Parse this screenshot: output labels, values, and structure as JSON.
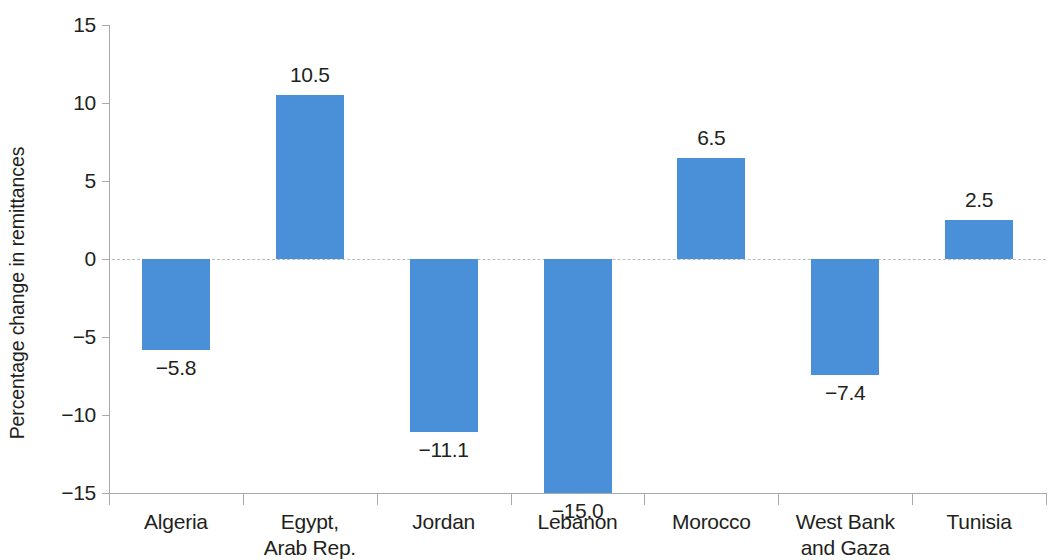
{
  "chart_data": {
    "type": "bar",
    "title": "",
    "subtitle": "",
    "xlabel": "",
    "ylabel": "Percentage change in remittances",
    "categories": [
      "Algeria",
      "Egypt, Arab Rep.",
      "Jordan",
      "Lebanon",
      "Morocco",
      "West Bank and Gaza",
      "Tunisia"
    ],
    "category_lines": [
      [
        "Algeria"
      ],
      [
        "Egypt,",
        "Arab Rep."
      ],
      [
        "Jordan"
      ],
      [
        "Lebanon"
      ],
      [
        "Morocco"
      ],
      [
        "West Bank",
        "and Gaza"
      ],
      [
        "Tunisia"
      ]
    ],
    "values": [
      -5.8,
      10.5,
      -11.1,
      -15.0,
      6.5,
      -7.4,
      2.5
    ],
    "value_labels": [
      "−5.8",
      "10.5",
      "−11.1",
      "−15.0",
      "6.5",
      "−7.4",
      "2.5"
    ],
    "ylim": [
      -15,
      15
    ],
    "yticks": [
      15,
      10,
      5,
      0,
      -5,
      -10,
      -15
    ],
    "ytick_labels": [
      "15",
      "10",
      "5",
      "0",
      "−5",
      "−10",
      "−15"
    ],
    "grid": false,
    "zero_line": true,
    "legend": null,
    "bar_color": "#4a90d9",
    "axis_color": "#a7a9ac",
    "zero_line_color": "#b9bbbd",
    "text_color": "#231f20",
    "note": "Lebanon bar is clipped at the axis minimum of −15.0; its label is drawn above the zero line."
  }
}
